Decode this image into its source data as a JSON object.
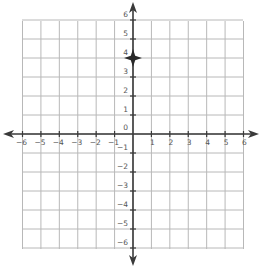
{
  "diagram": {
    "type": "coordinate-plane",
    "x_range": [
      -6,
      6
    ],
    "y_range": [
      -6,
      6
    ],
    "x_tick_labels": [
      "-6",
      "-5",
      "-4",
      "-3",
      "-2",
      "-1",
      "1",
      "2",
      "3",
      "4",
      "5",
      "6"
    ],
    "y_tick_labels_positive": [
      "1",
      "2",
      "3",
      "4",
      "5",
      "6"
    ],
    "y_tick_labels_negative": [
      "-1",
      "-2",
      "-3",
      "-4",
      "-5",
      "-6"
    ],
    "origin_label": "0",
    "plotted_point": {
      "x": 0,
      "y": 4,
      "marker": "four-point-star"
    },
    "colors": {
      "grid": "#b8b8b8",
      "axis": "#3a3a3a",
      "label": "#555555"
    }
  }
}
